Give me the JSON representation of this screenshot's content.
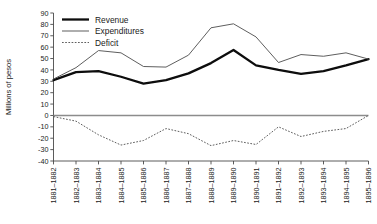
{
  "chart_data": {
    "type": "line",
    "title": "",
    "subtitle": "",
    "xlabel": "",
    "ylabel": "Millions of pesos",
    "ylim": [
      -40,
      90
    ],
    "ytick_step": 10,
    "yticks": [
      90,
      80,
      70,
      60,
      50,
      40,
      30,
      20,
      10,
      0,
      -10,
      -20,
      -30,
      -40
    ],
    "grid": false,
    "zero_line": true,
    "legend_position": "top-left",
    "categories": [
      "1881–1882",
      "1882–1883",
      "1883–1884",
      "1884–1885",
      "1885–1886",
      "1886–1887",
      "1887–1888",
      "1888–1889",
      "1889–1890",
      "1890–1891",
      "1891–1892",
      "1892–1893",
      "1893–1894",
      "1894–1895",
      "1895–1896"
    ],
    "series": [
      {
        "name": "Revenue",
        "style": "thick-solid",
        "color": "#0d0d0d",
        "values": [
          31,
          38,
          39,
          34,
          28,
          31,
          37,
          46,
          57.5,
          44,
          40,
          36.5,
          39,
          44,
          49.5
        ]
      },
      {
        "name": "Expenditures",
        "style": "thin-solid",
        "color": "#555555",
        "values": [
          32,
          42,
          57,
          55,
          43,
          42.5,
          53,
          77,
          80.5,
          69,
          46.5,
          53.5,
          52,
          55,
          49.5
        ]
      },
      {
        "name": "Deficit",
        "style": "dotted",
        "color": "#555555",
        "values": [
          -1,
          -5,
          -17,
          -26,
          -22,
          -11.5,
          -16,
          -26.5,
          -22,
          -25.5,
          -10,
          -18.5,
          -14,
          -11.5,
          0
        ]
      }
    ]
  },
  "legend": {
    "items": [
      {
        "label": "Revenue"
      },
      {
        "label": "Expenditures"
      },
      {
        "label": "Deficit"
      }
    ]
  }
}
